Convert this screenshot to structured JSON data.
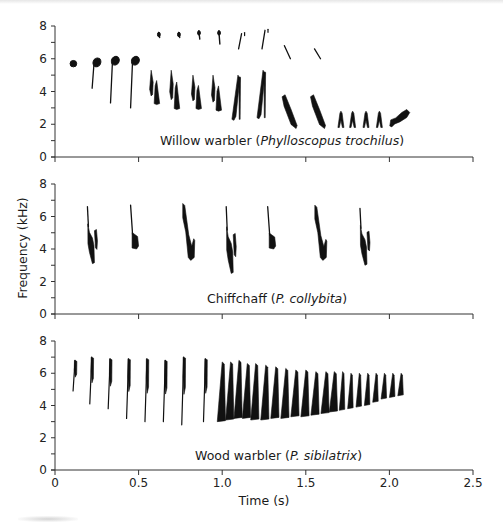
{
  "figure": {
    "y_axis_label": "Frequency (kHz)",
    "x_axis_label": "Time (s)",
    "x_ticks": [
      "0",
      "0.5",
      "1.0",
      "1.5",
      "2.0",
      "2.5"
    ],
    "y_ticks": [
      "0",
      "2",
      "4",
      "6",
      "8"
    ],
    "panels": [
      {
        "caption_plain": "Willow warbler (",
        "caption_italic": "Phylloscopus trochilus",
        "caption_end": ")"
      },
      {
        "caption_plain": "Chiffchaff (",
        "caption_italic": "P. collybita",
        "caption_end": ")"
      },
      {
        "caption_plain": "Wood warbler (",
        "caption_italic": "P. sibilatrix",
        "caption_end": ")"
      }
    ]
  },
  "chart_data": {
    "type": "spectrogram",
    "title": "",
    "xlabel": "Time (s)",
    "ylabel": "Frequency (kHz)",
    "xlim": [
      0,
      2.5
    ],
    "ylim": [
      0,
      8
    ],
    "x_ticks": [
      0,
      0.5,
      1.0,
      1.5,
      2.0,
      2.5
    ],
    "y_ticks": [
      0,
      2,
      4,
      6,
      8
    ],
    "y_minor_tick_step": 1,
    "grid": false,
    "layout": "three stacked panels sharing the time axis; only bottom panel has x tick labels",
    "panels": [
      {
        "species": "Willow warbler",
        "scientific_name": "Phylloscopus trochilus",
        "song_start_s": 0.1,
        "song_end_s": 2.1,
        "syllables": [
          {
            "t": 0.11,
            "f_low": 5.5,
            "f_high": 5.9,
            "shape": "dot"
          },
          {
            "t": 0.24,
            "f_low": 4.2,
            "f_high": 6.0,
            "shape": "flag"
          },
          {
            "t": 0.35,
            "f_low": 3.3,
            "f_high": 6.1,
            "shape": "flag"
          },
          {
            "t": 0.47,
            "f_low": 3.0,
            "f_high": 6.1,
            "shape": "flag"
          },
          {
            "t": 0.59,
            "f_low": 3.2,
            "f_high": 5.3,
            "shape": "double"
          },
          {
            "t": 0.71,
            "f_low": 2.9,
            "f_high": 5.3,
            "shape": "double"
          },
          {
            "t": 0.84,
            "f_low": 2.9,
            "f_high": 5.0,
            "shape": "double"
          },
          {
            "t": 0.96,
            "f_low": 2.8,
            "f_high": 5.0,
            "shape": "double"
          },
          {
            "t": 1.1,
            "f_low": 2.3,
            "f_high": 5.0,
            "shape": "inverted-v"
          },
          {
            "t": 1.25,
            "f_low": 2.4,
            "f_high": 5.3,
            "shape": "inverted-v"
          },
          {
            "t": 1.4,
            "f_low": 1.8,
            "f_high": 3.8,
            "shape": "descending-blob"
          },
          {
            "t": 1.57,
            "f_low": 1.8,
            "f_high": 3.8,
            "shape": "descending-blob"
          },
          {
            "t": 1.71,
            "f_low": 1.8,
            "f_high": 2.8,
            "shape": "small-v"
          },
          {
            "t": 1.78,
            "f_low": 1.8,
            "f_high": 2.8,
            "shape": "small-v"
          },
          {
            "t": 1.86,
            "f_low": 1.8,
            "f_high": 2.8,
            "shape": "small-v"
          },
          {
            "t": 1.94,
            "f_low": 1.8,
            "f_high": 2.8,
            "shape": "small-v"
          },
          {
            "t": 2.05,
            "f_low": 1.9,
            "f_high": 2.9,
            "shape": "rising-blob"
          }
        ],
        "harmonics": [
          {
            "t": 0.62,
            "f_low": 7.3,
            "f_high": 7.6
          },
          {
            "t": 0.74,
            "f_low": 7.3,
            "f_high": 7.6
          },
          {
            "t": 0.86,
            "f_low": 7.2,
            "f_high": 7.7
          },
          {
            "t": 0.98,
            "f_low": 6.9,
            "f_high": 7.7
          },
          {
            "t": 1.11,
            "f_low": 6.6,
            "f_high": 7.6
          },
          {
            "t": 1.25,
            "f_low": 6.6,
            "f_high": 7.8
          },
          {
            "t": 1.39,
            "f_low": 6.0,
            "f_high": 6.8
          },
          {
            "t": 1.57,
            "f_low": 6.0,
            "f_high": 6.6
          }
        ]
      },
      {
        "species": "Chiffchaff",
        "scientific_name": "P. collybita",
        "song_start_s": 0.17,
        "song_end_s": 1.95,
        "syllables": [
          {
            "t": 0.2,
            "f_low": 3.1,
            "f_high": 6.6,
            "shape": "hook-double"
          },
          {
            "t": 0.47,
            "f_low": 4.0,
            "f_high": 6.7,
            "shape": "flag"
          },
          {
            "t": 0.77,
            "f_low": 3.3,
            "f_high": 6.8,
            "shape": "slanted-hook"
          },
          {
            "t": 1.03,
            "f_low": 2.5,
            "f_high": 6.6,
            "shape": "hook-double"
          },
          {
            "t": 1.29,
            "f_low": 4.0,
            "f_high": 6.6,
            "shape": "flag"
          },
          {
            "t": 1.56,
            "f_low": 3.3,
            "f_high": 6.7,
            "shape": "slanted-hook"
          },
          {
            "t": 1.83,
            "f_low": 3.0,
            "f_high": 6.5,
            "shape": "hook-double"
          }
        ]
      },
      {
        "species": "Wood warbler",
        "scientific_name": "P. sibilatrix",
        "song_start_s": 0.1,
        "song_end_s": 2.1,
        "description": "accelerating trill: sparse syllables to ~1.0 s, then dense buzzy trill decreasing in bandwidth to 2.1 s",
        "syllables": [
          {
            "t": 0.12,
            "f_low": 4.9,
            "f_high": 6.8
          },
          {
            "t": 0.22,
            "f_low": 4.1,
            "f_high": 7.0
          },
          {
            "t": 0.33,
            "f_low": 3.8,
            "f_high": 6.9
          },
          {
            "t": 0.44,
            "f_low": 3.2,
            "f_high": 6.9
          },
          {
            "t": 0.55,
            "f_low": 3.0,
            "f_high": 6.9
          },
          {
            "t": 0.66,
            "f_low": 3.0,
            "f_high": 6.8
          },
          {
            "t": 0.77,
            "f_low": 2.8,
            "f_high": 7.0
          },
          {
            "t": 0.9,
            "f_low": 3.0,
            "f_high": 6.9
          },
          {
            "t": 1.0,
            "f_low": 3.0,
            "f_high": 6.7
          },
          {
            "t": 1.05,
            "f_low": 3.1,
            "f_high": 6.7
          },
          {
            "t": 1.1,
            "f_low": 3.2,
            "f_high": 6.8
          },
          {
            "t": 1.15,
            "f_low": 3.2,
            "f_high": 6.6
          },
          {
            "t": 1.2,
            "f_low": 3.1,
            "f_high": 6.6
          },
          {
            "t": 1.26,
            "f_low": 3.1,
            "f_high": 6.5
          },
          {
            "t": 1.32,
            "f_low": 3.2,
            "f_high": 6.4
          },
          {
            "t": 1.38,
            "f_low": 3.2,
            "f_high": 6.3
          },
          {
            "t": 1.44,
            "f_low": 3.3,
            "f_high": 6.2
          },
          {
            "t": 1.5,
            "f_low": 3.3,
            "f_high": 6.2
          },
          {
            "t": 1.56,
            "f_low": 3.4,
            "f_high": 6.1
          },
          {
            "t": 1.62,
            "f_low": 3.5,
            "f_high": 6.1
          },
          {
            "t": 1.67,
            "f_low": 3.6,
            "f_high": 6.1
          },
          {
            "t": 1.72,
            "f_low": 3.7,
            "f_high": 6.1
          },
          {
            "t": 1.77,
            "f_low": 3.8,
            "f_high": 6.0
          },
          {
            "t": 1.82,
            "f_low": 3.9,
            "f_high": 6.0
          },
          {
            "t": 1.87,
            "f_low": 4.0,
            "f_high": 6.0
          },
          {
            "t": 1.92,
            "f_low": 4.2,
            "f_high": 6.0
          },
          {
            "t": 1.97,
            "f_low": 4.4,
            "f_high": 6.0
          },
          {
            "t": 2.02,
            "f_low": 4.5,
            "f_high": 6.0
          },
          {
            "t": 2.07,
            "f_low": 4.6,
            "f_high": 6.0
          }
        ]
      }
    ]
  }
}
